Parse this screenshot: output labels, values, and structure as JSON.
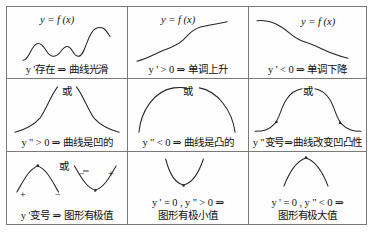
{
  "figure": {
    "type": "math-reference-table",
    "columns": 3,
    "rows": 3,
    "or_label": "或"
  },
  "cells": [
    {
      "id": "r1c1",
      "function_label": "y = f (x)",
      "caption": "y '存在 ⇒ 曲线光滑",
      "curve_name": "smooth-wavy-curve",
      "meaning": "derivative exists implies curve is smooth"
    },
    {
      "id": "r1c2",
      "function_label": "y = f (x)",
      "caption": "y ' > 0 ⇒ 单调上升",
      "curve_name": "increasing-curve",
      "meaning": "positive first derivative implies monotonically increasing"
    },
    {
      "id": "r1c3",
      "function_label": "y = f (x)",
      "caption": "y ' < 0 ⇒ 单调下降",
      "curve_name": "decreasing-curve",
      "meaning": "negative first derivative implies monotonically decreasing"
    },
    {
      "id": "r2c1",
      "or_label": "或",
      "caption": "y \" > 0 ⇒ 曲线是凹的",
      "curve_name": "concave-up-branches",
      "meaning": "positive second derivative implies concave curve"
    },
    {
      "id": "r2c2",
      "or_label": "或",
      "caption": "y \" < 0 ⇒ 曲线是凸的",
      "curve_name": "concave-down-arc",
      "meaning": "negative second derivative implies convex curve"
    },
    {
      "id": "r2c3",
      "or_label": "或",
      "caption": "y \"变号⇒曲线改变凹凸性",
      "curve_name": "inflection-bell-curve",
      "meaning": "second derivative sign change implies concavity change"
    },
    {
      "id": "r3c1",
      "or_label": "或",
      "caption": "y '变号 ⇒ 图形有极值",
      "curve_name": "extremum-sign-change",
      "signs": [
        "+",
        "−",
        "−",
        "+"
      ],
      "meaning": "first derivative sign change implies an extremum"
    },
    {
      "id": "r3c2",
      "caption_line1": "y ' = 0 , y \" > 0 ⇒",
      "caption_line2": "图形有极小值",
      "curve_name": "local-minimum-parabola",
      "meaning": "zero first derivative with positive second derivative implies local minimum"
    },
    {
      "id": "r3c3",
      "caption_line1": "y ' = 0 , y \" < 0 ⇒",
      "caption_line2": "图形有极大值",
      "curve_name": "local-maximum-parabola",
      "meaning": "zero first derivative with negative second derivative implies local maximum"
    }
  ],
  "colors": {
    "border": "#7a7a7a",
    "curve": "#262626",
    "text": "#111111",
    "background": "#ffffff"
  }
}
